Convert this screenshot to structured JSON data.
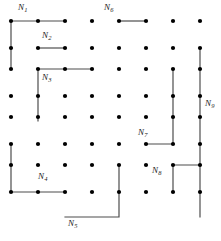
{
  "figure": {
    "type": "lattice-path-diagram",
    "width": 221,
    "height": 241,
    "background_color": "#ffffff",
    "dot_color": "#000000",
    "line_color": "#4d4d4d",
    "label_color": "#1a1a1a",
    "dot_radius": 2.1,
    "line_width": 1.2
  },
  "grid": {
    "columns": 8,
    "rows": 8,
    "x_positions": [
      11,
      38,
      65,
      92,
      119,
      146,
      173,
      200
    ],
    "y_positions": [
      21,
      48,
      69,
      96,
      117,
      144,
      165,
      192
    ],
    "description": "8 by 8 array of lattice points"
  },
  "labels": [
    {
      "id": "N1",
      "base": "N",
      "sub": "1",
      "x": 18,
      "y": 3
    },
    {
      "id": "N2",
      "base": "N",
      "sub": "2",
      "x": 42,
      "y": 31
    },
    {
      "id": "N3",
      "base": "N",
      "sub": "3",
      "x": 42,
      "y": 73
    },
    {
      "id": "N4",
      "base": "N",
      "sub": "4",
      "x": 38,
      "y": 172
    },
    {
      "id": "N5",
      "base": "N",
      "sub": "5",
      "x": 68,
      "y": 219
    },
    {
      "id": "N6",
      "base": "N",
      "sub": "6",
      "x": 104,
      "y": 3
    },
    {
      "id": "N7",
      "base": "N",
      "sub": "7",
      "x": 138,
      "y": 128
    },
    {
      "id": "N8",
      "base": "N",
      "sub": "8",
      "x": 152,
      "y": 166
    },
    {
      "id": "N9",
      "base": "N",
      "sub": "9",
      "x": 205,
      "y": 99
    }
  ],
  "paths": [
    {
      "id": "N1",
      "points": "11,69 11,21 65,21"
    },
    {
      "id": "N2",
      "points": "38,48 65,48"
    },
    {
      "id": "N3",
      "points": "38,121 38,69 92,69"
    },
    {
      "id": "N4",
      "points": "11,144 11,192 65,192"
    },
    {
      "id": "N5",
      "points": "65,217 119,217 119,165"
    },
    {
      "id": "N6",
      "points": "119,21 146,21"
    },
    {
      "id": "N7",
      "points": "146,144 173,144 173,69"
    },
    {
      "id": "N8",
      "points": "173,192 173,165 200,165"
    },
    {
      "id": "N9",
      "points": "200,48 200,217"
    }
  ]
}
